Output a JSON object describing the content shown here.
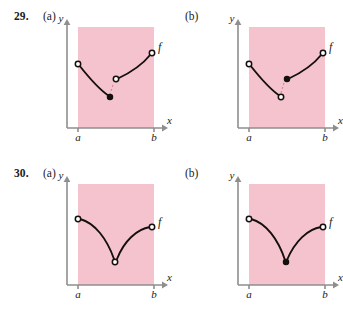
{
  "page": {
    "width": 343,
    "height": 313,
    "background": "#ffffff",
    "style": "textbook-exercise-figure"
  },
  "colors": {
    "region_fill": "#f5c3cd",
    "axis": "#8e8e8e",
    "curve": "#15100f",
    "dashed_connector": "#c98a92",
    "open_point_fill": "#ffffff",
    "text": "#1a1a1a"
  },
  "exercises": [
    {
      "number": "29.",
      "parts": [
        {
          "label": "(a)",
          "axes": {
            "y_label": "y",
            "x_label": "x",
            "left_tick_label": "a",
            "right_tick_label": "b",
            "function_label": "f"
          },
          "description": "Two decreasing-then-increasing arcs with a jump discontinuity; left arc ends at a closed point below an open point where the right arc begins.",
          "points": [
            {
              "kind": "open",
              "x": 78,
              "y": 64
            },
            {
              "kind": "closed",
              "x": 110,
              "y": 97
            },
            {
              "kind": "open",
              "x": 116,
              "y": 79
            },
            {
              "kind": "open",
              "x": 152,
              "y": 53
            }
          ]
        },
        {
          "label": "(b)",
          "axes": {
            "y_label": "y",
            "x_label": "x",
            "left_tick_label": "a",
            "right_tick_label": "b",
            "function_label": "f"
          },
          "description": "Two arcs with a jump discontinuity; left arc ends at an open point below a closed point where the right arc begins.",
          "points": [
            {
              "kind": "open",
              "x": 78,
              "y": 64
            },
            {
              "kind": "open",
              "x": 110,
              "y": 97
            },
            {
              "kind": "closed",
              "x": 116,
              "y": 79
            },
            {
              "kind": "open",
              "x": 152,
              "y": 53
            }
          ]
        }
      ]
    },
    {
      "number": "30.",
      "parts": [
        {
          "label": "(a)",
          "axes": {
            "y_label": "y",
            "x_label": "x",
            "left_tick_label": "a",
            "right_tick_label": "b",
            "function_label": "f"
          },
          "description": "A V-shaped curve with a removable discontinuity: the minimum vertex is an open point.",
          "points": [
            {
              "kind": "open",
              "x": 78,
              "y": 62
            },
            {
              "kind": "open",
              "x": 115,
              "y": 105
            },
            {
              "kind": "open",
              "x": 152,
              "y": 70
            }
          ]
        },
        {
          "label": "(b)",
          "axes": {
            "y_label": "y",
            "x_label": "x",
            "left_tick_label": "a",
            "right_tick_label": "b",
            "function_label": "f"
          },
          "description": "A V-shaped curve that is continuous at the minimum: the vertex is a closed point.",
          "points": [
            {
              "kind": "open",
              "x": 78,
              "y": 62
            },
            {
              "kind": "closed",
              "x": 115,
              "y": 105
            },
            {
              "kind": "open",
              "x": 152,
              "y": 70
            }
          ]
        }
      ]
    }
  ]
}
